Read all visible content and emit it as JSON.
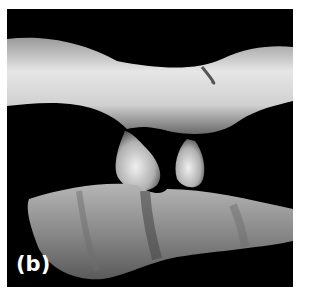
{
  "figure": {
    "panel_label": "(b)",
    "background_color": "#000000",
    "page_color": "#ffffff"
  }
}
